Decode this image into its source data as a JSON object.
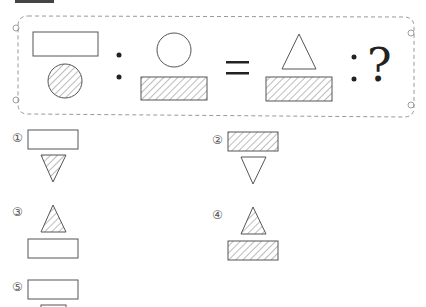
{
  "question": {
    "operator_ratio": ":",
    "operator_equals": "=",
    "unknown": "?"
  },
  "options": [
    {
      "label": "①"
    },
    {
      "label": "②"
    },
    {
      "label": "③"
    },
    {
      "label": "④"
    },
    {
      "label": "⑤"
    }
  ],
  "colors": {
    "stroke": "#555555",
    "hatch": "#555555",
    "dash": "#999999"
  }
}
